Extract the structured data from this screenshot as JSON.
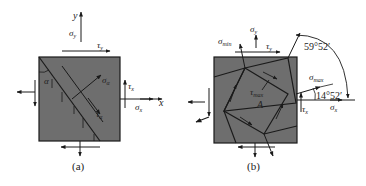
{
  "colors": {
    "element_fill": "#6e6e6e",
    "line": "#1a1a1a",
    "background": "#ffffff"
  },
  "figure_a": {
    "caption": "(a)",
    "axis_x": "x",
    "axis_y": "y",
    "sigma_y": "σ",
    "sigma_y_sub": "y",
    "tau_y": "τ",
    "tau_y_sub": "y",
    "tau_x": "τ",
    "tau_x_sub": "x",
    "sigma_x": "σ",
    "sigma_x_sub": "x",
    "sigma_alpha": "σ",
    "sigma_alpha_sub": "α",
    "tau_alpha": "τ",
    "tau_alpha_sub": "α",
    "angle": "α"
  },
  "figure_b": {
    "caption": "(b)",
    "sigma_y": "σ",
    "sigma_y_sub": "y",
    "tau_y": "τ",
    "tau_y_sub": "y",
    "sigma_min": "σ",
    "sigma_min_sub": "min",
    "sigma_max": "σ",
    "sigma_max_sub": "max",
    "tau_x": "τ",
    "tau_x_sub": "x",
    "sigma_x": "σ",
    "sigma_x_sub": "x",
    "tau_max": "τ",
    "tau_max_sub": "max",
    "point": "A",
    "angle_large": "59°52′",
    "angle_small": "14°52′"
  }
}
